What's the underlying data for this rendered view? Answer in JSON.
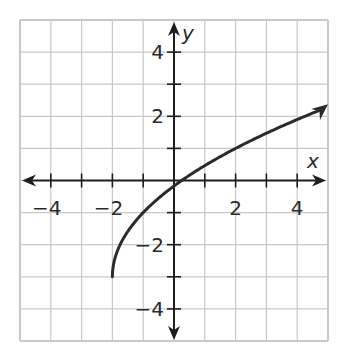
{
  "chart_data": {
    "type": "line",
    "title": "",
    "xlabel": "x",
    "ylabel": "y",
    "xlim": [
      -5,
      5
    ],
    "ylim": [
      -5,
      5
    ],
    "grid": true,
    "grid_step": 1,
    "legend": null,
    "x_tick_labels": [
      {
        "value": -4,
        "label": "−4"
      },
      {
        "value": -2,
        "label": "−2"
      },
      {
        "value": 2,
        "label": "2"
      },
      {
        "value": 4,
        "label": "4"
      }
    ],
    "y_tick_labels": [
      {
        "value": 4,
        "label": "4"
      },
      {
        "value": 2,
        "label": "2"
      },
      {
        "value": -2,
        "label": "−2"
      },
      {
        "value": -4,
        "label": "−4"
      }
    ],
    "series": [
      {
        "name": "f(x) = 2√(x+2) − 3",
        "start_point": {
          "x": -2,
          "y": -3,
          "closed": true
        },
        "end_arrow": true,
        "x": [
          -2,
          -1.5,
          -1,
          -0.5,
          0,
          1,
          2,
          3,
          4,
          5
        ],
        "y": [
          -3,
          -1.59,
          -1,
          -0.84,
          -0.17,
          0.46,
          1,
          1.47,
          1.9,
          2.29
        ]
      }
    ]
  },
  "colors": {
    "grid": "#c8c8c8",
    "axis": "#1e1e1e",
    "curve": "#2b2b2b",
    "background": "#ffffff"
  }
}
